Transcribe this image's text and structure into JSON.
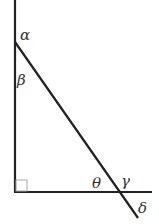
{
  "diagram": {
    "type": "angle-diagram",
    "colors": {
      "line": "#222222",
      "label": "#333333",
      "right_angle_mark": "#aaaaaa"
    },
    "angles": {
      "alpha": "α",
      "beta": "β",
      "theta": "θ",
      "gamma": "γ",
      "delta": "δ"
    },
    "right_angle_marker": true
  }
}
